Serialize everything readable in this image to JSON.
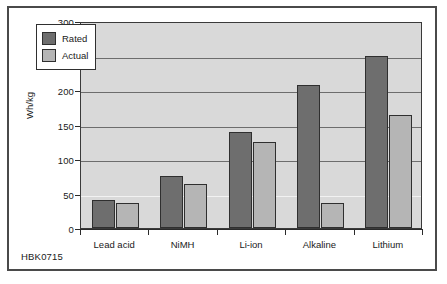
{
  "figure": {
    "code_label": "HBK0715"
  },
  "chart_data": {
    "type": "bar",
    "title": "",
    "xlabel": "",
    "ylabel": "Wh/kg",
    "ylim": [
      0,
      300
    ],
    "yticks": [
      0,
      50,
      100,
      150,
      200,
      250,
      300
    ],
    "ytick_labels": [
      "0",
      "50",
      "100",
      "150",
      "200",
      "250",
      "300"
    ],
    "grid": true,
    "grid_axis": "y",
    "legend_position": "upper left",
    "categories": [
      "Lead acid",
      "NiMH",
      "Li-ion",
      "Alkaline",
      "Lithium"
    ],
    "series": [
      {
        "name": "Rated",
        "color": "#6e6e6e",
        "values": [
          40,
          75,
          139,
          207,
          250
        ]
      },
      {
        "name": "Actual",
        "color": "#b5b5b5",
        "values": [
          36,
          64,
          124,
          36,
          164
        ]
      }
    ]
  }
}
